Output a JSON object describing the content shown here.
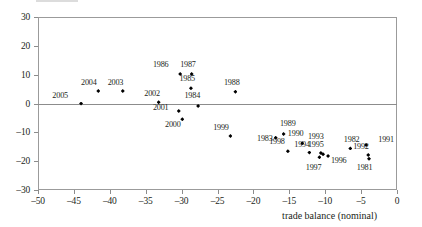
{
  "chart_data": {
    "type": "scatter",
    "title": "",
    "xlabel": "trade balance (nominal)",
    "ylabel": "",
    "xlim": [
      -50,
      0
    ],
    "ylim": [
      -30,
      30
    ],
    "xticks": [
      -50,
      -45,
      -40,
      -35,
      -30,
      -25,
      -20,
      -15,
      -10,
      -5,
      0
    ],
    "xticklabels": [
      "–50",
      "–45",
      "–40",
      "–35",
      "–30",
      "–25",
      "–20",
      "–15",
      "–10",
      "–5",
      "0"
    ],
    "yticks": [
      -30,
      -20,
      -10,
      0,
      10,
      20,
      30
    ],
    "yticklabels": [
      "–30",
      "–20",
      "–10",
      "0",
      "10",
      "20",
      "30"
    ],
    "grid": false,
    "zero_line": true,
    "legend": "none",
    "marker": "diamond",
    "marker_color": "#000000",
    "points": [
      {
        "label": "2005",
        "x": -44.0,
        "y": 0.0,
        "lx": -48.0,
        "ly": 2.6
      },
      {
        "label": "2004",
        "x": -41.6,
        "y": 4.3,
        "lx": -44.0,
        "ly": 7.2
      },
      {
        "label": "2003",
        "x": -38.2,
        "y": 4.3,
        "lx": -40.3,
        "ly": 7.2
      },
      {
        "label": "2002",
        "x": -33.2,
        "y": 0.4,
        "lx": -35.2,
        "ly": 3.4
      },
      {
        "label": "2001",
        "x": -30.4,
        "y": -2.6,
        "lx": -34.0,
        "ly": -1.6
      },
      {
        "label": "2000",
        "x": -29.9,
        "y": -5.5,
        "lx": -32.3,
        "ly": -7.6
      },
      {
        "label": "1999",
        "x": -23.2,
        "y": -11.3,
        "lx": -25.6,
        "ly": -8.6
      },
      {
        "label": "1998",
        "x": -15.2,
        "y": -16.6,
        "lx": -17.8,
        "ly": -13.4
      },
      {
        "label": "1997",
        "x": -10.8,
        "y": -18.6,
        "lx": -12.7,
        "ly": -22.2
      },
      {
        "label": "1996",
        "x": -9.6,
        "y": -18.2,
        "lx": -9.2,
        "ly": -20.0
      },
      {
        "label": "1995",
        "x": -10.3,
        "y": -17.6,
        "lx": -12.4,
        "ly": -14.4
      },
      {
        "label": "1994",
        "x": -12.2,
        "y": -17.0,
        "lx": -14.3,
        "ly": -14.4
      },
      {
        "label": "1993",
        "x": -10.6,
        "y": -17.2,
        "lx": -12.4,
        "ly": -11.6
      },
      {
        "label": "1992",
        "x": -4.0,
        "y": -17.9,
        "lx": -6.1,
        "ly": -15.1
      },
      {
        "label": "1991",
        "x": -4.3,
        "y": -14.4,
        "lx": -2.6,
        "ly": -12.5
      },
      {
        "label": "1990",
        "x": -13.2,
        "y": -13.8,
        "lx": -15.2,
        "ly": -10.6
      },
      {
        "label": "1989",
        "x": -15.8,
        "y": -10.6,
        "lx": -16.3,
        "ly": -7.2
      },
      {
        "label": "1988",
        "x": -22.5,
        "y": 4.1,
        "lx": -24.1,
        "ly": 7.2
      },
      {
        "label": "1987",
        "x": -28.6,
        "y": 10.2,
        "lx": -30.2,
        "ly": 13.4
      },
      {
        "label": "1986",
        "x": -30.2,
        "y": 10.2,
        "lx": -34.0,
        "ly": 13.4
      },
      {
        "label": "1985",
        "x": -28.7,
        "y": 5.3,
        "lx": -30.3,
        "ly": 8.6
      },
      {
        "label": "1984",
        "x": -27.7,
        "y": -0.9,
        "lx": -29.6,
        "ly": 2.6
      },
      {
        "label": "1983",
        "x": -16.9,
        "y": -11.9,
        "lx": -19.5,
        "ly": -12.2
      },
      {
        "label": "1982",
        "x": -6.5,
        "y": -15.6,
        "lx": -7.4,
        "ly": -12.5
      },
      {
        "label": "1981",
        "x": -3.9,
        "y": -19.2,
        "lx": -5.6,
        "ly": -22.2
      }
    ]
  }
}
